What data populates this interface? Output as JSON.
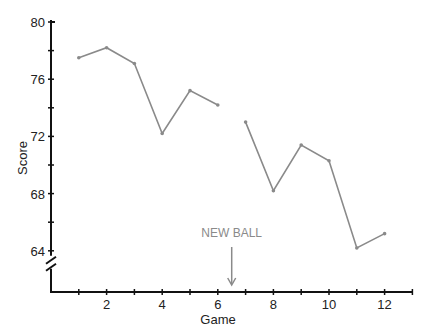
{
  "chart_data": {
    "type": "line",
    "title": "",
    "xlabel": "Game",
    "ylabel": "Score",
    "x": [
      1,
      2,
      3,
      4,
      5,
      6,
      7,
      8,
      9,
      10,
      11,
      12
    ],
    "series": [
      {
        "name": "Score (old ball)",
        "x": [
          1,
          2,
          3,
          4,
          5,
          6
        ],
        "values": [
          77.5,
          78.2,
          77.1,
          72.2,
          75.2,
          74.2
        ]
      },
      {
        "name": "Score (new ball)",
        "x": [
          7,
          8,
          9,
          10,
          11,
          12
        ],
        "values": [
          73.0,
          68.2,
          71.4,
          70.3,
          64.2,
          65.2
        ]
      }
    ],
    "x_ticks": [
      1,
      2,
      3,
      4,
      5,
      6,
      7,
      8,
      9,
      10,
      11,
      12,
      13
    ],
    "x_tick_labels": [
      "2",
      "4",
      "6",
      "8",
      "10",
      "12"
    ],
    "y_tick_labels": [
      "64",
      "68",
      "72",
      "76",
      "80"
    ],
    "ylim": [
      64,
      80
    ],
    "xlim": [
      0,
      13
    ],
    "grid": false,
    "legend": null,
    "axis_break": "y-axis below 64",
    "annotations": [
      {
        "text": "NEW BALL",
        "x": 6.5,
        "type": "arrow-down"
      }
    ],
    "colors": {
      "line": "#8a8a8a",
      "axis": "#111111",
      "annotation": "#8a8a8a"
    }
  }
}
